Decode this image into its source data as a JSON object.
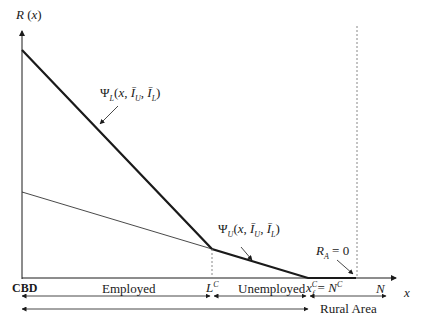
{
  "diagram": {
    "axes": {
      "y_label": "R (x)",
      "x_label": "x"
    },
    "curves": {
      "psi_L": "Ψ_L(x, Ī_U, Ī_L)",
      "psi_U": "Ψ_U(x, Ī_U, Ī_L)",
      "rural_rent": "R_A = 0"
    },
    "x_ticks": {
      "origin": "CBD",
      "lc": "L^C",
      "xf": "x_f^C = N^C",
      "n": "N"
    },
    "zones": {
      "employed": "Employed",
      "unemployed": "Unemployed",
      "rural": "Rural Area"
    },
    "colors": {
      "line": "#1a1a1a",
      "dashed": "#888888"
    }
  }
}
